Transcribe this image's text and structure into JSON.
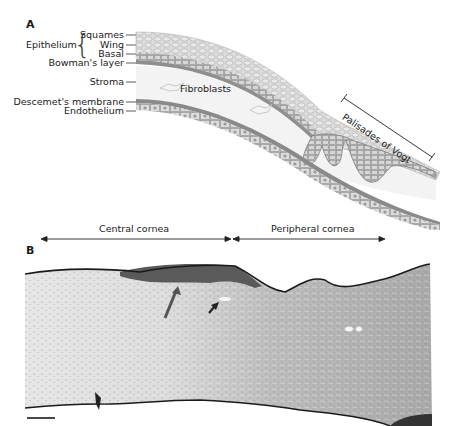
{
  "panel_a": {
    "label": "A",
    "group_label": "Epithelium",
    "layers": [
      {
        "name": "Squames"
      },
      {
        "name": "Wing"
      },
      {
        "name": "Basal"
      },
      {
        "name": "Bowman's layer"
      },
      {
        "name": "Stroma"
      },
      {
        "name": "Descemet's membrane"
      },
      {
        "name": "Endothelium"
      }
    ],
    "annotations": {
      "fibroblasts": "Fibroblasts",
      "palisades": "Palisades of Vogt"
    },
    "colors": {
      "epithelium": "#d8d8d8",
      "cell_outline": "#9a9a9a",
      "basal": "#bfbfbf",
      "bowman": "#8f8f8f",
      "stroma": "#f4f4f4",
      "descemet": "#8a8a8a",
      "endothelium": "#cfcfcf"
    }
  },
  "region_axis": {
    "central": "Central cornea",
    "peripheral": "Peripheral cornea"
  },
  "panel_b": {
    "label": "B",
    "description": "Histological section of cornea",
    "markers": [
      {
        "type": "long-arrow",
        "color": "#555555"
      },
      {
        "type": "short-arrow",
        "color": "#222222"
      }
    ],
    "scale_bar": true
  }
}
